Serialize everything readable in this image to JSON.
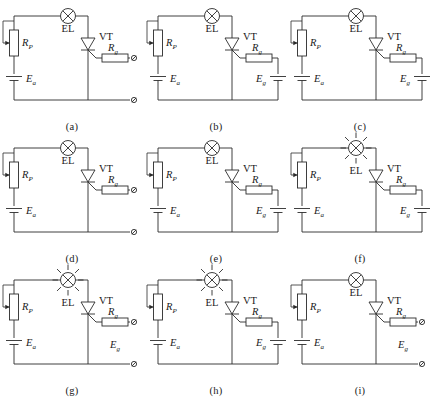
{
  "figure": {
    "rows": 3,
    "columns": 3,
    "line_color": "#2b2b2b",
    "background": "#ffffff"
  },
  "labels": {
    "lamp": "EL",
    "thyristor": "VT",
    "potentiometer": "R",
    "potentiometer_sub": "P",
    "gate_resistor": "R",
    "gate_resistor_sub": "g",
    "anode_supply": "E",
    "anode_supply_sub": "a",
    "gate_supply": "E",
    "gate_supply_sub": "g"
  },
  "panels": [
    {
      "id": "a",
      "caption": "(a)",
      "lamp_state": "off",
      "gate_supply_present": false,
      "gate_supply_label_shown": false,
      "open_terminals": 2
    },
    {
      "id": "b",
      "caption": "(b)",
      "lamp_state": "off",
      "gate_supply_present": true,
      "gate_supply_label_shown": true,
      "open_terminals": 0
    },
    {
      "id": "c",
      "caption": "(c)",
      "lamp_state": "off",
      "gate_supply_present": true,
      "gate_supply_label_shown": true,
      "open_terminals": 0
    },
    {
      "id": "d",
      "caption": "(d)",
      "lamp_state": "off",
      "gate_supply_present": false,
      "gate_supply_label_shown": false,
      "open_terminals": 2
    },
    {
      "id": "e",
      "caption": "(e)",
      "lamp_state": "off",
      "gate_supply_present": true,
      "gate_supply_label_shown": true,
      "open_terminals": 0
    },
    {
      "id": "f",
      "caption": "(f)",
      "lamp_state": "on",
      "gate_supply_present": true,
      "gate_supply_label_shown": true,
      "open_terminals": 0
    },
    {
      "id": "g",
      "caption": "(g)",
      "lamp_state": "on",
      "gate_supply_present": false,
      "gate_supply_label_shown": true,
      "open_terminals": 2
    },
    {
      "id": "h",
      "caption": "(h)",
      "lamp_state": "on",
      "gate_supply_present": true,
      "gate_supply_label_shown": true,
      "open_terminals": 0
    },
    {
      "id": "i",
      "caption": "(i)",
      "lamp_state": "off",
      "gate_supply_present": false,
      "gate_supply_label_shown": true,
      "open_terminals": 2
    }
  ]
}
